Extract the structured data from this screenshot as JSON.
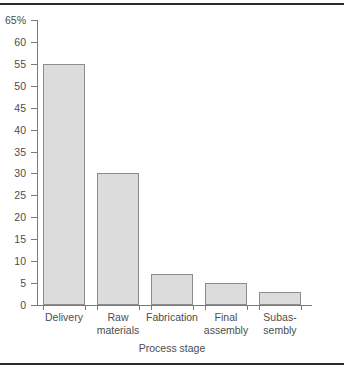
{
  "chart_data": {
    "type": "bar",
    "title": "",
    "xlabel": "Process stage",
    "ylabel": "",
    "categories": [
      "Delivery",
      "Raw materials",
      "Fabrication",
      "Final assembly",
      "Subas-sembly"
    ],
    "category_lines": [
      [
        "Delivery"
      ],
      [
        "Raw",
        "materials"
      ],
      [
        "Fabrication"
      ],
      [
        "Final",
        "assembly"
      ],
      [
        "Subas-",
        "sembly"
      ]
    ],
    "values": [
      55,
      30,
      7,
      5,
      3
    ],
    "ylim": [
      0,
      65
    ],
    "ytick_values": [
      0,
      5,
      10,
      15,
      20,
      25,
      30,
      35,
      40,
      45,
      50,
      55,
      60,
      65
    ],
    "ytick_labels": [
      "0",
      "5",
      "10",
      "15",
      "20",
      "25",
      "30",
      "35",
      "40",
      "45",
      "50",
      "55",
      "60",
      "65%"
    ],
    "unit": "%",
    "grid": false,
    "legend": null,
    "colors": {
      "bar_fill": "#dcdcdc",
      "bar_border": "#8c8c8c",
      "axis": "#7a7a7a",
      "text": "#4d4d4d",
      "rule": "#2b2b2b",
      "background": "#ffffff"
    }
  }
}
